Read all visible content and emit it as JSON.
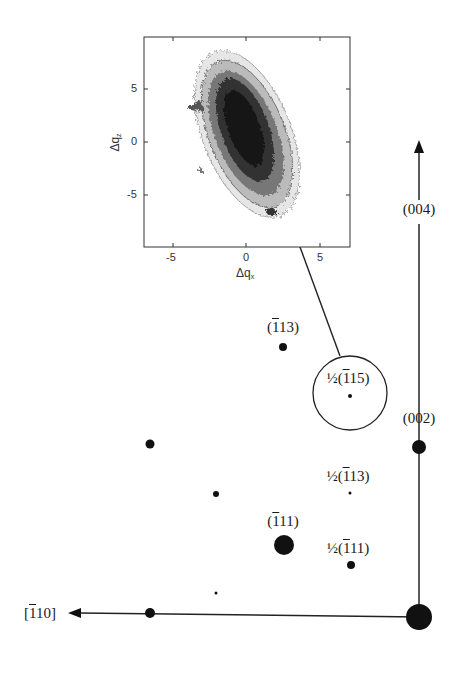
{
  "figure": {
    "type": "reciprocal-space diffraction map with inset reciprocal space map",
    "axes": {
      "vertical_axis_label": "(004)",
      "horizontal_axis_label_prefix": "[",
      "horizontal_axis_label_bar": "1",
      "horizontal_axis_label_rest": "10]"
    },
    "reflections": [
      {
        "id": "000",
        "label": "",
        "x": 419,
        "y": 617,
        "r": 13
      },
      {
        "id": "002",
        "label": "(002)",
        "x": 419,
        "y": 447,
        "r": 7
      },
      {
        "id": "004",
        "label": "(004)",
        "x": 419,
        "y": 140,
        "r": 0
      },
      {
        "id": "-113",
        "label_pre": "(",
        "label_bar": "1",
        "label_post": "13)",
        "x": 283,
        "y": 347,
        "r": 4
      },
      {
        "id": "-111",
        "label_pre": "(",
        "label_bar": "1",
        "label_post": "11)",
        "x": 284,
        "y": 545,
        "r": 10
      },
      {
        "id": "half-115",
        "label_pre": "½(",
        "label_bar": "1",
        "label_post": "15)",
        "x": 350,
        "y": 396,
        "r": 2
      },
      {
        "id": "half-113",
        "label_pre": "½(",
        "label_bar": "1",
        "label_post": "13)",
        "x": 350,
        "y": 493,
        "r": 1.5
      },
      {
        "id": "half-111",
        "label_pre": "½(",
        "label_bar": "1",
        "label_post": "11)",
        "x": 351,
        "y": 565,
        "r": 4
      },
      {
        "id": "unlabeled-a",
        "x": 150,
        "y": 444,
        "r": 4.5
      },
      {
        "id": "unlabeled-b",
        "x": 216,
        "y": 494,
        "r": 3
      },
      {
        "id": "unlabeled-c",
        "x": 216,
        "y": 593,
        "r": 1.5
      },
      {
        "id": "unlabeled-d",
        "x": 150,
        "y": 613,
        "r": 5
      }
    ],
    "highlight_circle": {
      "cx": 350,
      "cy": 393,
      "r": 37
    },
    "inset": {
      "xlabel": "Δq",
      "xlabel_sub": "x",
      "ylabel": "Δq",
      "ylabel_sub": "z",
      "x_ticks": [
        "-5",
        "0",
        "5"
      ],
      "y_ticks": [
        "5",
        "0",
        "-5"
      ],
      "xlim": [
        -7,
        7
      ],
      "ylim": [
        -9.5,
        9
      ],
      "plot_type": "contour map (grayscale)"
    }
  },
  "chart_data": {
    "type": "heatmap",
    "title": "",
    "xlabel": "Δq_x",
    "ylabel": "Δq_z",
    "x_ticks": [
      -5,
      0,
      5
    ],
    "y_ticks": [
      -5,
      0,
      5
    ],
    "xlim": [
      -7,
      7
    ],
    "ylim": [
      -9.5,
      9
    ],
    "peak_center": [
      0,
      0.5
    ]
  }
}
